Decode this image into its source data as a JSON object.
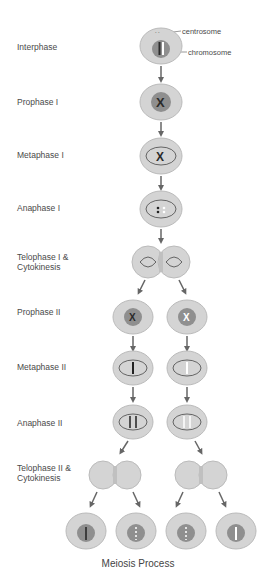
{
  "diagram": {
    "title": "Meiosis Process",
    "callouts": {
      "centrosome": "centrosome",
      "chromosome": "chromosome"
    },
    "stages": [
      {
        "label": "Interphase"
      },
      {
        "label": "Prophase I"
      },
      {
        "label": "Metaphase I"
      },
      {
        "label": "Anaphase I"
      },
      {
        "label": "Telophase I &\nCytokinesis",
        "line1": "Telophase I &",
        "line2": "Cytokinesis"
      },
      {
        "label": "Prophase II"
      },
      {
        "label": "Metaphase II"
      },
      {
        "label": "Anaphase II"
      },
      {
        "label": "Telophase II &\nCytokinesis",
        "line1": "Telophase II &",
        "line2": "Cytokinesis"
      }
    ],
    "colors": {
      "cell": "#d4d4d4",
      "cell_border": "#b8b8b8",
      "nucleus": "#8f8f8f",
      "chromosome": "#2a2a2a",
      "arrow": "#666666"
    }
  }
}
